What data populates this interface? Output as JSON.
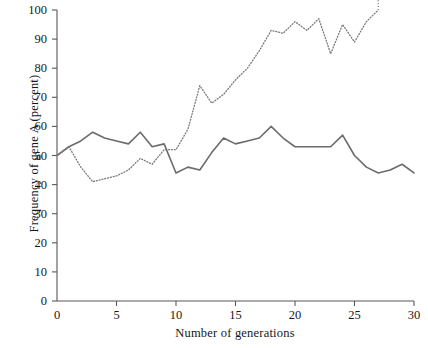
{
  "chart_data": {
    "type": "line",
    "title": "",
    "xlabel": "Number of generations",
    "ylabel": "Frequency of gene A (percent)",
    "xlim": [
      0,
      30
    ],
    "ylim": [
      0,
      100
    ],
    "grid": false,
    "legend": "none",
    "x_ticks": [
      0,
      5,
      10,
      15,
      20,
      25,
      30
    ],
    "x_tick_labels": [
      "0",
      "5",
      "10",
      "15",
      "20",
      "25",
      "30"
    ],
    "y_ticks": [
      0,
      10,
      20,
      30,
      40,
      50,
      60,
      70,
      80,
      90,
      100
    ],
    "y_tick_labels": [
      "0",
      "10",
      "20",
      "30",
      "40",
      "50",
      "60",
      "70",
      "80",
      "90",
      "100"
    ],
    "series": [
      {
        "name": "solid-population",
        "style": "solid",
        "color": "#6b6b6b",
        "x": [
          0,
          1,
          2,
          3,
          4,
          5,
          6,
          7,
          8,
          9,
          10,
          11,
          12,
          13,
          14,
          15,
          16,
          17,
          18,
          19,
          20,
          21,
          22,
          23,
          24,
          25,
          26,
          27,
          28,
          29,
          30
        ],
        "values": [
          50,
          53,
          55,
          58,
          56,
          55,
          54,
          58,
          53,
          54,
          44,
          46,
          45,
          51,
          56,
          54,
          55,
          56,
          60,
          56,
          53,
          53,
          53,
          53,
          57,
          50,
          46,
          44,
          45,
          47,
          44
        ]
      },
      {
        "name": "dotted-population",
        "style": "dotted",
        "color": "#7a7a7a",
        "x": [
          0,
          1,
          2,
          3,
          4,
          5,
          6,
          7,
          8,
          9,
          10,
          11,
          12,
          13,
          14,
          15,
          16,
          17,
          18,
          19,
          20,
          21,
          22,
          23,
          24,
          25,
          26,
          27
        ],
        "values": [
          50,
          53,
          46,
          41,
          42,
          43,
          45,
          49,
          47,
          52,
          52,
          59,
          74,
          68,
          71,
          76,
          80,
          86,
          93,
          92,
          96,
          93,
          97,
          85,
          95,
          89,
          96,
          100
        ]
      }
    ]
  },
  "axes": {
    "y_title": "Frequency of gene A (percent)",
    "x_title": "Number of generations"
  }
}
